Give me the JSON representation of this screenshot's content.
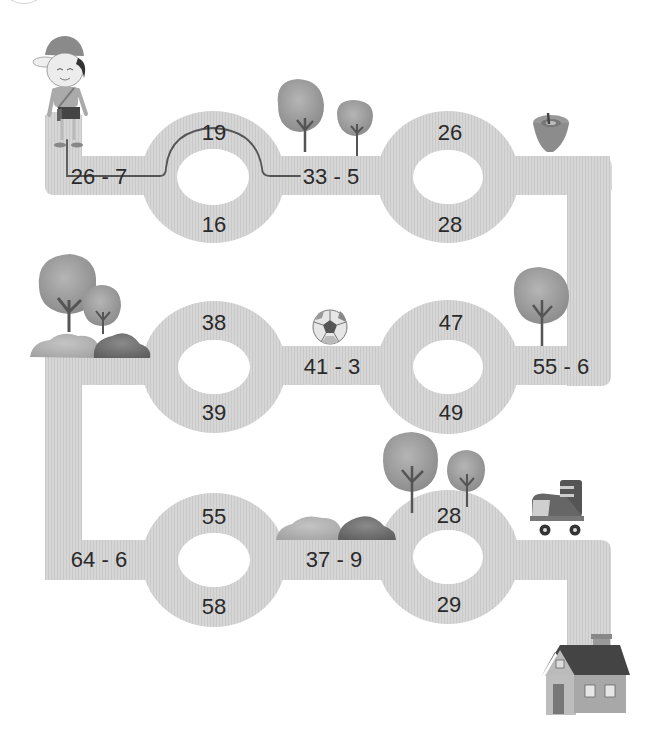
{
  "puzzle": {
    "type": "subtraction-maze",
    "start": "boy",
    "end": "house",
    "colors": {
      "road": "#d4d4d4",
      "road_stripe": "#c8c8c8",
      "text": "#2a2a2a",
      "trace_line": "#555555",
      "background": "#ffffff"
    },
    "problems": [
      {
        "id": "p1",
        "expression": "26 - 7",
        "display": "26 - 7"
      },
      {
        "id": "p2",
        "expression": "33 - 5",
        "display": "33 - 5"
      },
      {
        "id": "p3",
        "expression": "55 - 6",
        "display": "55 - 6"
      },
      {
        "id": "p4",
        "expression": "41 - 3",
        "display": "41 - 3"
      },
      {
        "id": "p5",
        "expression": "64 - 6",
        "display": "64 - 6"
      },
      {
        "id": "p6",
        "expression": "37 - 9",
        "display": "37 - 9"
      }
    ],
    "rings": [
      {
        "id": "r1",
        "top": "19",
        "bottom": "16",
        "traced": "top"
      },
      {
        "id": "r2",
        "top": "26",
        "bottom": "28"
      },
      {
        "id": "r3",
        "top": "47",
        "bottom": "49"
      },
      {
        "id": "r4",
        "top": "38",
        "bottom": "39"
      },
      {
        "id": "r5",
        "top": "55",
        "bottom": "58"
      },
      {
        "id": "r6",
        "top": "28",
        "bottom": "29"
      }
    ],
    "decorations": [
      "boy-with-cap",
      "tree",
      "tree",
      "spinning-top",
      "tree",
      "trees-and-bushes",
      "soccer-ball",
      "trees",
      "bushes",
      "roller-skate",
      "house"
    ]
  }
}
